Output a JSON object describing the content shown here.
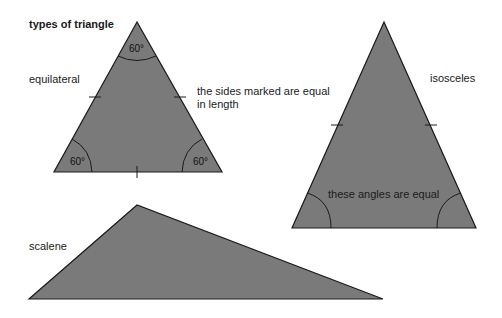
{
  "title": "types of triangle",
  "colors": {
    "fill": "#7a7a7a",
    "stroke": "#1a1a1a",
    "background": "#ffffff"
  },
  "equilateral": {
    "label": "equilateral",
    "angles": [
      "60°",
      "60°",
      "60°"
    ],
    "note_line1": "the sides marked are equal",
    "note_line2": "in length"
  },
  "isosceles": {
    "label": "isosceles",
    "angle_note": "these angles are equal"
  },
  "scalene": {
    "label": "scalene"
  }
}
